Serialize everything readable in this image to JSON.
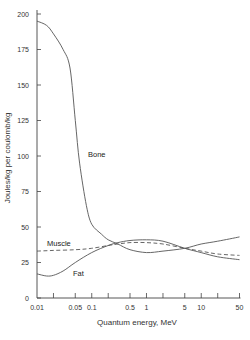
{
  "chart_data": {
    "type": "line",
    "title": "",
    "xlabel": "Quantum energy, MeV",
    "ylabel": "Joules/kg per coulomb/kg",
    "xscale": "log",
    "xlim": [
      0.01,
      50
    ],
    "ylim": [
      0,
      200
    ],
    "grid": false,
    "legend": "inline curve labels",
    "x_ticks": [
      0.01,
      0.02,
      0.05,
      0.1,
      0.2,
      0.5,
      1,
      2,
      5,
      10,
      20,
      50
    ],
    "x_tick_labels": [
      "0.01",
      "",
      "0.05",
      "0.1",
      "",
      "0.5",
      "1",
      "",
      "5",
      "10",
      "",
      "50"
    ],
    "y_ticks": [
      0,
      25,
      50,
      75,
      100,
      125,
      150,
      175,
      200
    ],
    "y_tick_labels": [
      "0",
      "25",
      "50",
      "75",
      "100",
      "125",
      "150",
      "175",
      "200"
    ],
    "series": [
      {
        "name": "Bone",
        "style": "solid",
        "x": [
          0.01,
          0.015,
          0.02,
          0.03,
          0.04,
          0.05,
          0.06,
          0.08,
          0.1,
          0.15,
          0.2,
          0.3,
          0.5,
          1,
          2,
          5,
          10,
          20,
          50
        ],
        "y": [
          195,
          192,
          186,
          175,
          162,
          125,
          95,
          65,
          52,
          45,
          41,
          38,
          34,
          32,
          33,
          35,
          38,
          40,
          43
        ]
      },
      {
        "name": "Muscle",
        "style": "dashed",
        "x": [
          0.01,
          0.02,
          0.05,
          0.1,
          0.2,
          0.3,
          0.5,
          1,
          2,
          5,
          10,
          20,
          50
        ],
        "y": [
          33,
          33.5,
          34,
          35,
          37,
          38,
          39,
          39,
          38,
          35,
          33,
          31,
          30
        ]
      },
      {
        "name": "Fat",
        "style": "solid",
        "x": [
          0.01,
          0.015,
          0.02,
          0.03,
          0.05,
          0.1,
          0.2,
          0.3,
          0.5,
          1,
          2,
          5,
          10,
          20,
          50
        ],
        "y": [
          17,
          15.5,
          16,
          19,
          25,
          32,
          37,
          39,
          40.5,
          41,
          40,
          35,
          32,
          29,
          27
        ]
      }
    ],
    "annotations": [
      {
        "text": "Bone",
        "x": 0.12,
        "y": 100
      },
      {
        "text": "Muscle",
        "x": 0.02,
        "y": 41
      },
      {
        "text": "Fat",
        "x": 0.045,
        "y": 20
      }
    ]
  },
  "labels": {
    "xlabel": "Quantum energy, MeV",
    "ylabel": "Joules/kg per coulomb/kg",
    "bone": "Bone",
    "muscle": "Muscle",
    "fat": "Fat"
  }
}
